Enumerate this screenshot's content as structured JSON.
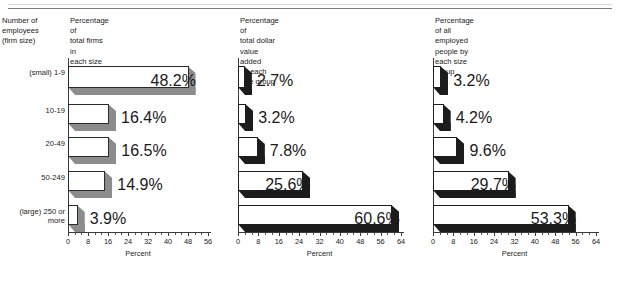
{
  "figure": {
    "background": "#ffffff",
    "row_label_header": "Number of\nemployees\n(firm size)",
    "axis_title": "Percent",
    "categories": [
      {
        "prefix": "(small)",
        "label": "1-9"
      },
      {
        "prefix": "",
        "label": "10-19"
      },
      {
        "prefix": "",
        "label": "20-49"
      },
      {
        "prefix": "",
        "label": "50-249"
      },
      {
        "prefix": "(large)",
        "label": "250 or\nmore"
      }
    ]
  },
  "chart_data": [
    {
      "type": "bar",
      "orientation": "horizontal",
      "title": "Percentage of\ntotal firms in\neach size group",
      "xlabel": "Percent",
      "ylabel": "",
      "categories": [
        "1-9",
        "10-19",
        "20-49",
        "50-249",
        "250 or more"
      ],
      "values": [
        48.2,
        16.4,
        16.5,
        14.9,
        3.9
      ],
      "value_labels": [
        "48.2%",
        "16.4%",
        "16.5%",
        "14.9%",
        "3.9%"
      ],
      "xlim": [
        0,
        56
      ],
      "xticks": [
        0,
        8,
        16,
        24,
        32,
        40,
        48,
        56
      ],
      "xticklabels": [
        "0",
        "8",
        "16",
        "24",
        "32",
        "40",
        "48",
        "56"
      ],
      "grid": false,
      "legend": "none",
      "bar_face_color": "#ffffff",
      "bar_side_color": "#8c8c8c",
      "bar_edge_color": "#2b2b2b"
    },
    {
      "type": "bar",
      "orientation": "horizontal",
      "title": "Percentage of\ntotal dollar value added\nby each size group",
      "xlabel": "Percent",
      "ylabel": "",
      "categories": [
        "1-9",
        "10-19",
        "20-49",
        "50-249",
        "250 or more"
      ],
      "values": [
        2.7,
        3.2,
        7.8,
        25.6,
        60.6
      ],
      "value_labels": [
        "2.7%",
        "3.2%",
        "7.8%",
        "25.6%",
        "60.6%"
      ],
      "xlim": [
        0,
        64
      ],
      "xticks": [
        0,
        8,
        16,
        24,
        32,
        40,
        48,
        56,
        64
      ],
      "xticklabels": [
        "0",
        "8",
        "16",
        "24",
        "32",
        "40",
        "48",
        "56",
        "64"
      ],
      "grid": false,
      "legend": "none",
      "bar_face_color": "#ffffff",
      "bar_side_color": "#1c1c1c",
      "bar_edge_color": "#1c1c1c"
    },
    {
      "type": "bar",
      "orientation": "horizontal",
      "title": "Percentage of all\nemployed people by\neach size group",
      "xlabel": "Percent",
      "ylabel": "",
      "categories": [
        "1-9",
        "10-19",
        "20-49",
        "50-249",
        "250 or more"
      ],
      "values": [
        3.2,
        4.2,
        9.6,
        29.7,
        53.3
      ],
      "value_labels": [
        "3.2%",
        "4.2%",
        "9.6%",
        "29.7%",
        "53.3%"
      ],
      "xlim": [
        0,
        64
      ],
      "xticks": [
        0,
        8,
        16,
        24,
        32,
        40,
        48,
        56,
        64
      ],
      "xticklabels": [
        "0",
        "8",
        "16",
        "24",
        "32",
        "40",
        "48",
        "56",
        "64"
      ],
      "grid": false,
      "legend": "none",
      "bar_face_color": "#ffffff",
      "bar_side_color": "#1c1c1c",
      "bar_edge_color": "#1c1c1c"
    }
  ]
}
